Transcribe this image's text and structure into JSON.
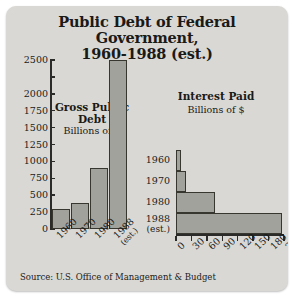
{
  "title": {
    "line1": "Public Debt of Federal Government,",
    "line2": "1960-1988 (est.)"
  },
  "source": "Source: U.S. Office of Management & Budget",
  "chart_data": [
    {
      "type": "bar",
      "title": "Gross Public Debt",
      "subtitle": "Billions of $",
      "orientation": "vertical",
      "categories": [
        "1960",
        "1970",
        "1980",
        "1988"
      ],
      "category_sublabels": [
        "",
        "",
        "",
        "(est.)"
      ],
      "values": [
        290,
        380,
        907,
        2500
      ],
      "xlabel": "",
      "ylabel": "Billions of $",
      "ylim": [
        0,
        2500
      ],
      "yticks": [
        0,
        250,
        500,
        750,
        1000,
        1250,
        1500,
        1750,
        2000,
        2250,
        2500
      ],
      "ytick_labels": [
        "0",
        "250",
        "500",
        "750",
        "1000",
        "1250",
        "1500",
        "1750",
        "2000",
        "",
        "2500"
      ],
      "grid": false,
      "legend": "none",
      "bar_color": "#a2a29c",
      "bar_border_color": "#37372f"
    },
    {
      "type": "bar",
      "title": "Interest Paid",
      "subtitle": "Billions of $",
      "orientation": "horizontal",
      "categories": [
        "1960",
        "1970",
        "1980",
        "1988"
      ],
      "category_sublabels": [
        "",
        "",
        "",
        "(est.)"
      ],
      "values": [
        9,
        19,
        75,
        206
      ],
      "xlabel": "",
      "ylabel": "",
      "xlim": [
        0,
        210
      ],
      "xticks": [
        0,
        30,
        60,
        90,
        120,
        150,
        180,
        210
      ],
      "xtick_labels": [
        "0",
        "30",
        "60",
        "90",
        "120",
        "150",
        "180",
        "210"
      ],
      "grid": false,
      "legend": "none",
      "bar_color": "#a2a29c",
      "bar_border_color": "#37372f"
    }
  ],
  "colors": {
    "card_background": "#d9d8d4",
    "axis": "#2b2b29",
    "text": "#1a1a18"
  }
}
